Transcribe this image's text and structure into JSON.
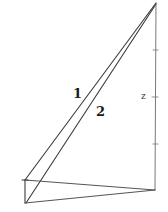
{
  "diagram": {
    "type": "geometric-figure",
    "line_color": "#3a3a3a",
    "labels": {
      "line1": "1",
      "line2": "2",
      "height": "z"
    },
    "points": {
      "apex": [
        156,
        3
      ],
      "base_right": [
        155,
        190
      ],
      "base_left_top": [
        25,
        180
      ],
      "base_left_bottom": [
        25,
        203
      ]
    },
    "height_ticks_y": [
      50,
      97,
      144
    ]
  }
}
